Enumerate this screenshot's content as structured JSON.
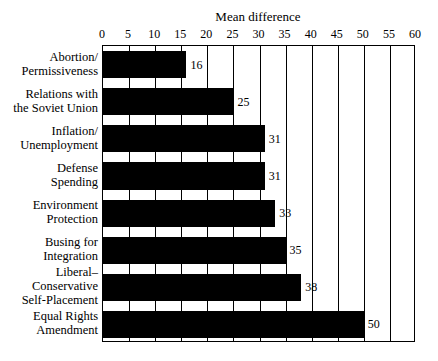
{
  "chart_data": {
    "type": "bar",
    "orientation": "horizontal",
    "title": "Mean difference",
    "xlabel": "",
    "ylabel": "",
    "xlim": [
      0,
      60
    ],
    "xticks": [
      0,
      5,
      10,
      15,
      20,
      25,
      30,
      35,
      40,
      45,
      50,
      55,
      60
    ],
    "tick_labels": [
      "0",
      "5",
      "10",
      "15",
      "20",
      "25",
      "30",
      "35",
      "40",
      "45",
      "50",
      "55",
      "60"
    ],
    "grid": true,
    "legend": null,
    "bar_color": "#000000",
    "frame_color": "#000000",
    "background": "#ffffff",
    "categories": [
      "Abortion/\nPermissiveness",
      "Relations with\nthe Soviet Union",
      "Inflation/\nUnemployment",
      "Defense\nSpending",
      "Environment\nProtection",
      "Busing for\nIntegration",
      "Liberal–\nConservative\nSelf-Placement",
      "Equal Rights\nAmendment"
    ],
    "values": [
      16,
      25,
      31,
      31,
      33,
      35,
      38,
      50
    ],
    "value_labels": [
      "16",
      "25",
      "31",
      "31",
      "33",
      "35",
      "38",
      "50"
    ]
  }
}
